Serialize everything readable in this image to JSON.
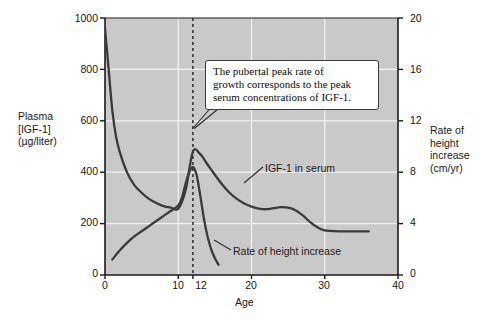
{
  "chart_data": {
    "type": "line",
    "title": "",
    "xlabel": "Age",
    "ylabel": "Plasma [IGF-1] (µg/liter)",
    "y2label": "Rate of height increase (cm/yr)",
    "xlim": [
      0,
      40
    ],
    "ylim": [
      0,
      1000
    ],
    "y2lim": [
      0,
      20
    ],
    "grid": true,
    "grid_color": "#f2f2f2",
    "plot_background": "#c9c9c9",
    "page_background": "#ffffff",
    "line_color": "#3a3a3a",
    "xticks": [
      0,
      10,
      12,
      20,
      30,
      40
    ],
    "xtick_labels": [
      "0",
      "10",
      "12",
      "20",
      "30",
      "40"
    ],
    "yticks": [
      0,
      200,
      400,
      600,
      800,
      1000
    ],
    "ytick_labels": [
      "0",
      "200",
      "400",
      "600",
      "800",
      "1000"
    ],
    "y2ticks": [
      0,
      4,
      8,
      12,
      16,
      20
    ],
    "y2tick_labels": [
      "0",
      "4",
      "8",
      "12",
      "16",
      "20"
    ],
    "reference_line": {
      "x": 12,
      "style": "dashed",
      "color": "#2b2b2b"
    },
    "series": [
      {
        "name": "IGF-1 in serum",
        "axis": "left",
        "units": "µg/liter",
        "x": [
          0,
          0.5,
          1,
          1.5,
          2,
          3,
          4,
          5,
          6,
          7,
          8,
          9,
          10,
          11,
          12,
          13,
          14,
          15,
          16,
          17,
          18,
          19,
          20,
          21,
          22,
          23,
          24,
          25,
          26,
          27,
          28,
          29,
          30,
          32,
          34,
          36
        ],
        "y": [
          960,
          800,
          640,
          540,
          480,
          400,
          350,
          320,
          296,
          280,
          268,
          262,
          258,
          330,
          480,
          470,
          430,
          390,
          352,
          320,
          296,
          278,
          266,
          258,
          256,
          260,
          264,
          262,
          252,
          232,
          206,
          186,
          174,
          170,
          170,
          170
        ]
      },
      {
        "name": "Rate of height increase",
        "axis": "right",
        "units": "cm/yr",
        "x": [
          1,
          2,
          3,
          4,
          5,
          6,
          7,
          8,
          9,
          10,
          10.5,
          11,
          11.5,
          12,
          12.5,
          13,
          13.5,
          14,
          14.5,
          15,
          15.5
        ],
        "y": [
          1.2,
          1.9,
          2.5,
          3.0,
          3.4,
          3.8,
          4.2,
          4.6,
          5.0,
          5.4,
          6.0,
          7.1,
          8.0,
          8.4,
          7.8,
          6.2,
          4.4,
          3.0,
          2.0,
          1.3,
          0.8
        ]
      }
    ],
    "annotations": [
      {
        "name": "pubertal-peak-callout",
        "lines": [
          "The pubertal peak rate of",
          "growth corresponds to the peak",
          "serum concentrations of IGF-1."
        ],
        "pointer_to": {
          "x": 12,
          "y_left": 570
        }
      }
    ],
    "series_labels": [
      {
        "name": "IGF-1 in serum",
        "text": "IGF-1 in serum"
      },
      {
        "name": "Rate of height increase",
        "text": "Rate of height increase"
      }
    ]
  },
  "axes": {
    "left_title_lines": [
      "Plasma",
      "[IGF-1]",
      "(µg/liter)"
    ],
    "right_title_lines": [
      "Rate of",
      "height",
      "increase",
      "(cm/yr)"
    ],
    "x_title": "Age"
  }
}
